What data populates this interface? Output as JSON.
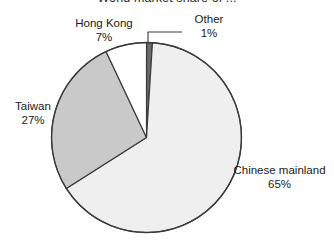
{
  "chart": {
    "title": "World market share of ..."
  },
  "chart_data": {
    "type": "pie",
    "title": "World market share of ...",
    "xlabel": "",
    "ylabel": "",
    "legend": "none",
    "grid": false,
    "start_angle_deg": 0,
    "direction": "clockwise",
    "units": "percent",
    "categories": [
      "Other",
      "Chinese mainland",
      "Taiwan",
      "Hong Kong"
    ],
    "values": [
      1,
      65,
      27,
      7
    ],
    "slices": [
      {
        "name": "Other",
        "label": "Other",
        "value": 1,
        "value_label": "1%",
        "color": "#6b6b6b",
        "has_leader_line": true
      },
      {
        "name": "Chinese mainland",
        "label": "Chinese mainland",
        "value": 65,
        "value_label": "65%",
        "color": "#efefef",
        "has_leader_line": false
      },
      {
        "name": "Taiwan",
        "label": "Taiwan",
        "value": 27,
        "value_label": "27%",
        "color": "#c9c9c9",
        "has_leader_line": false
      },
      {
        "name": "Hong Kong",
        "label": "Hong Kong",
        "value": 7,
        "value_label": "7%",
        "color": "#ffffff",
        "has_leader_line": false
      }
    ]
  },
  "labels": {
    "hong_kong": {
      "name": "Hong Kong",
      "percent": "7%"
    },
    "other": {
      "name": "Other",
      "percent": "1%"
    },
    "taiwan": {
      "name": "Taiwan",
      "percent": "27%"
    },
    "chinese_mainland": {
      "name": "Chinese mainland",
      "percent": "65%"
    }
  },
  "colors": {
    "outline": "#3a3a3a",
    "background": "#ffffff",
    "text": "#1a1a1a"
  }
}
